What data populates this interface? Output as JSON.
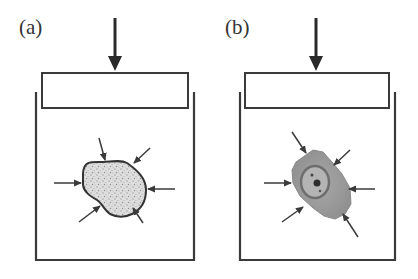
{
  "panels": [
    {
      "label": "(a)",
      "particle": "porous-granular"
    },
    {
      "label": "(b)",
      "particle": "cell-with-nucleus"
    }
  ],
  "colors": {
    "stroke": "#3a3a3a",
    "particle_a_fill": "#d8d8d8",
    "particle_b_fill": "#9a9a9a",
    "nucleus_fill": "#7a7a7a",
    "background": "#ffffff"
  }
}
